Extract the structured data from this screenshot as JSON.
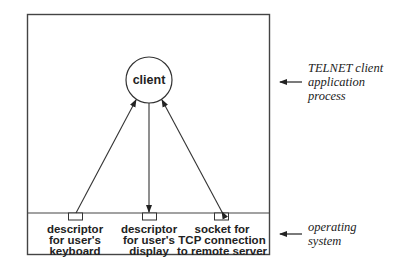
{
  "diagram": {
    "client_node": {
      "label": "client"
    },
    "descriptors": [
      {
        "lines": [
          "descriptor",
          "for user's",
          "keyboard"
        ]
      },
      {
        "lines": [
          "descriptor",
          "for user's",
          "display"
        ]
      },
      {
        "lines": [
          "socket for",
          "TCP connection",
          "to remote server"
        ]
      }
    ],
    "side_labels": {
      "application": [
        "TELNET client",
        "application",
        "process"
      ],
      "os": [
        "operating",
        "system"
      ]
    },
    "connections": [
      {
        "from": "descriptor for user's keyboard",
        "to": "client",
        "direction": "to-client"
      },
      {
        "from": "client",
        "to": "descriptor for user's display",
        "direction": "to-descriptor"
      },
      {
        "from": "client",
        "to": "socket for TCP connection to remote server",
        "direction": "bidirectional"
      }
    ],
    "colors": {
      "stroke": "#333333",
      "text": "#222222",
      "background": "#ffffff"
    }
  }
}
